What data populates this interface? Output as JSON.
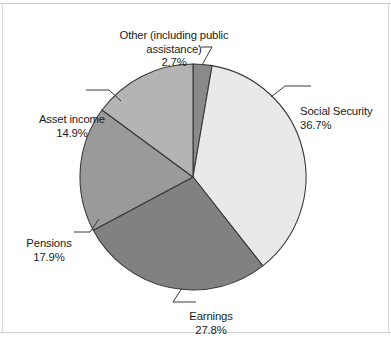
{
  "chart_data": {
    "type": "pie",
    "title": "",
    "subtitle": "",
    "xlabel": "",
    "ylabel": "",
    "legend_position": "none",
    "grid": false,
    "start_angle_deg": 0,
    "direction": "clockwise",
    "categories": [
      "Other (including public assistance)",
      "Social Security",
      "Earnings",
      "Pensions",
      "Asset income"
    ],
    "values": [
      2.7,
      36.7,
      27.8,
      17.9,
      14.9
    ],
    "value_suffix": "%",
    "slices": [
      {
        "label": "Other (including public",
        "label_line2": "assistance)",
        "value_text": "2.7%",
        "value": 2.7,
        "color": "#8a8a8a"
      },
      {
        "label": "Social Security",
        "label_line2": "",
        "value_text": "36.7%",
        "value": 36.7,
        "color": "#e9e9e9"
      },
      {
        "label": "Earnings",
        "label_line2": "",
        "value_text": "27.8%",
        "value": 27.8,
        "color": "#818181"
      },
      {
        "label": "Pensions",
        "label_line2": "",
        "value_text": "17.9%",
        "value": 17.9,
        "color": "#9a9a9a"
      },
      {
        "label": "Asset income",
        "label_line2": "",
        "value_text": "14.9%",
        "value": 14.9,
        "color": "#b4b4b4"
      }
    ]
  },
  "labels": {
    "other": {
      "line1": "Other (including public",
      "line2": "assistance)",
      "value": "2.7%"
    },
    "social_security": {
      "line1": "Social Security",
      "value": "36.7%"
    },
    "asset_income": {
      "line1": "Asset income",
      "value": "14.9%"
    },
    "pensions": {
      "line1": "Pensions",
      "value": "17.9%"
    },
    "earnings": {
      "line1": "Earnings",
      "value": "27.8%"
    }
  },
  "style": {
    "slice_outline": "#3a3a3a",
    "leader_line": "#3a3a3a",
    "background": "#ffffff"
  }
}
